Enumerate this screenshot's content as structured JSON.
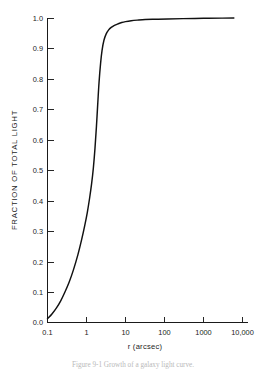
{
  "figure": {
    "caption": "Figure 9-1  Growth of a galaxy light curve.",
    "background_color": "#ffffff",
    "curve_color": "#111111",
    "axis_color": "#1a1a1a"
  },
  "chart_data": {
    "type": "line",
    "title": "",
    "subtitle": "",
    "xlabel": "r (arcsec)",
    "ylabel": "FRACTION OF TOTAL LIGHT",
    "xscale": "log",
    "yscale": "linear",
    "xlim": [
      0.1,
      17000
    ],
    "ylim": [
      0.0,
      1.0
    ],
    "grid": false,
    "legend": null,
    "legend_position": "none",
    "xtick_labels": [
      "0.1",
      "1",
      "10",
      "100",
      "1000",
      "10,000"
    ],
    "xtick_values": [
      0.1,
      1,
      10,
      100,
      1000,
      10000
    ],
    "ytick_labels": [
      "0.0",
      "0.1",
      "0.2",
      "0.3",
      "0.4",
      "0.5",
      "0.6",
      "0.7",
      "0.8",
      "0.9",
      "1.0"
    ],
    "ytick_values": [
      0.0,
      0.1,
      0.2,
      0.3,
      0.4,
      0.5,
      0.6,
      0.7,
      0.8,
      0.9,
      1.0
    ],
    "series": [
      {
        "name": "fraction of total light",
        "x": [
          0.1,
          0.13,
          0.17,
          0.22,
          0.28,
          0.36,
          0.46,
          0.6,
          0.75,
          0.9,
          1.05,
          1.2,
          1.35,
          1.5,
          1.65,
          1.8,
          1.95,
          2.1,
          2.3,
          2.5,
          2.8,
          3.2,
          3.7,
          4.3,
          5.2,
          6.5,
          8.0,
          10.0,
          14.0,
          20.0,
          32.0,
          60.0,
          120.0,
          300.0,
          1000.0,
          3000.0,
          6000.0
        ],
        "y": [
          0.012,
          0.028,
          0.048,
          0.072,
          0.1,
          0.133,
          0.172,
          0.222,
          0.272,
          0.318,
          0.362,
          0.408,
          0.455,
          0.508,
          0.572,
          0.645,
          0.722,
          0.79,
          0.852,
          0.893,
          0.927,
          0.948,
          0.961,
          0.969,
          0.976,
          0.981,
          0.985,
          0.988,
          0.991,
          0.993,
          0.995,
          0.996,
          0.997,
          0.998,
          0.999,
          0.9995,
          1.0
        ]
      }
    ]
  }
}
